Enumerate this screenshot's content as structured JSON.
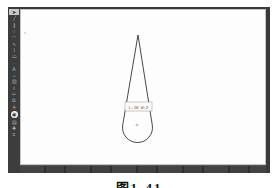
{
  "window": {
    "chrome_color": "#3a3a3a",
    "canvas_color": "#fdfdfd"
  },
  "toolbar": {
    "active_index": 0,
    "highlight_index": 16,
    "icons": [
      {
        "name": "select-tool-icon",
        "glyph": "➤"
      },
      {
        "name": "line-tool-icon",
        "glyph": "╱"
      },
      {
        "name": "parallel-tool-icon",
        "glyph": "∥"
      },
      {
        "name": "circle-tool-icon",
        "glyph": "○"
      },
      {
        "name": "arc-tool-icon",
        "glyph": "◠"
      },
      {
        "name": "spline-tool-icon",
        "glyph": "∿"
      },
      {
        "name": "polyline-tool-icon",
        "glyph": "⌇"
      },
      {
        "name": "rectangle-tool-icon",
        "glyph": "▭"
      },
      {
        "name": "point-tool-icon",
        "glyph": "·"
      },
      {
        "name": "text-tool-icon",
        "glyph": "A"
      },
      {
        "name": "dimension-tool-icon",
        "glyph": "↔"
      },
      {
        "name": "hatch-tool-icon",
        "glyph": "▨"
      },
      {
        "name": "erase-tool-icon",
        "glyph": "◊"
      },
      {
        "name": "trim-tool-icon",
        "glyph": "✂"
      },
      {
        "name": "mirror-tool-icon",
        "glyph": "⧉"
      },
      {
        "name": "move-tool-icon",
        "glyph": "✛"
      },
      {
        "name": "snap-tool-icon",
        "glyph": "◉"
      },
      {
        "name": "grid-tool-icon",
        "glyph": "▤"
      },
      {
        "name": "zoom-tool-icon",
        "glyph": "✚"
      },
      {
        "name": "layer-tool-icon",
        "glyph": "≡"
      }
    ]
  },
  "canvas": {
    "tooltip": {
      "text": "L:10 W:2"
    }
  },
  "caption": {
    "text": "图1-41"
  }
}
